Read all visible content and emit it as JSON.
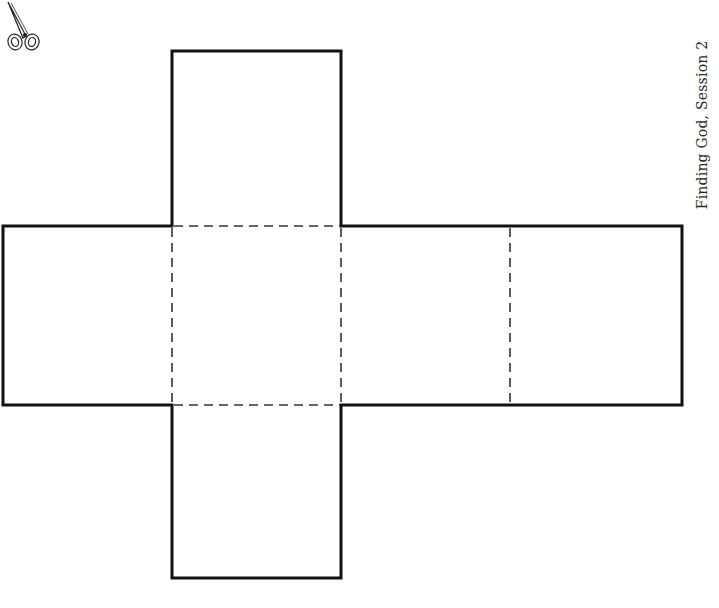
{
  "page": {
    "footer_label": "Finding God, Session 2"
  },
  "cube_net": {
    "stroke_color": "#111111",
    "fold_line_color": "#333333",
    "faces": [
      {
        "name": "top-flap",
        "x": 172,
        "y": 51,
        "w": 169,
        "h": 175
      },
      {
        "name": "left-face",
        "x": 3,
        "y": 226,
        "w": 169,
        "h": 179
      },
      {
        "name": "center-face",
        "x": 172,
        "y": 226,
        "w": 169,
        "h": 179
      },
      {
        "name": "right-face-1",
        "x": 341,
        "y": 226,
        "w": 169,
        "h": 179
      },
      {
        "name": "right-face-2",
        "x": 510,
        "y": 226,
        "w": 172,
        "h": 179
      },
      {
        "name": "bottom-flap",
        "x": 172,
        "y": 405,
        "w": 169,
        "h": 173
      }
    ]
  },
  "icons": {
    "scissors": "scissors-icon"
  }
}
